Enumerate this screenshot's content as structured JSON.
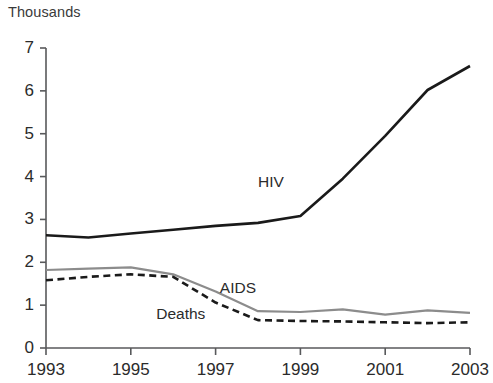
{
  "chart_data": {
    "type": "line",
    "title": "",
    "unit_label": "Thousands",
    "xlabel": "",
    "ylabel": "",
    "x": [
      1993,
      1994,
      1995,
      1996,
      1997,
      1998,
      1999,
      2000,
      2001,
      2002,
      2003
    ],
    "xlim": [
      1993,
      2003
    ],
    "ylim": [
      0,
      7
    ],
    "xticks": [
      1993,
      1995,
      1997,
      1999,
      2001,
      2003
    ],
    "xtick_labels": [
      "1993",
      "1995",
      "1997",
      "1999",
      "2001",
      "2003"
    ],
    "yticks": [
      0,
      1,
      2,
      3,
      4,
      5,
      6,
      7
    ],
    "ytick_labels": [
      "0",
      "1",
      "2",
      "3",
      "4",
      "5",
      "6",
      "7"
    ],
    "grid": false,
    "legend_position": "inline-annotations",
    "series": [
      {
        "name": "HIV",
        "style": "solid",
        "color": "#1a1a1a",
        "width": 2.6,
        "label_x": 1998.0,
        "label_y": 3.85,
        "values": [
          2.63,
          2.58,
          2.67,
          2.76,
          2.85,
          2.92,
          3.08,
          3.95,
          4.95,
          6.02,
          6.58
        ]
      },
      {
        "name": "AIDS",
        "style": "solid",
        "color": "#8c8c8c",
        "width": 2.2,
        "label_x": 1997.1,
        "label_y": 1.38,
        "values": [
          1.82,
          1.85,
          1.88,
          1.72,
          1.32,
          0.86,
          0.84,
          0.9,
          0.78,
          0.88,
          0.82
        ]
      },
      {
        "name": "Deaths",
        "style": "dashed",
        "color": "#1a1a1a",
        "width": 2.6,
        "label_x": 1995.6,
        "label_y": 0.78,
        "values": [
          1.58,
          1.66,
          1.72,
          1.66,
          1.06,
          0.65,
          0.63,
          0.62,
          0.6,
          0.58,
          0.6
        ]
      }
    ]
  }
}
